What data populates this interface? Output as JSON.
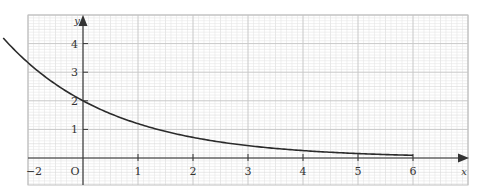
{
  "chart_data": {
    "type": "line",
    "title": "",
    "xlabel": "x",
    "ylabel": "y",
    "origin_label": "O",
    "xlim": [
      -1,
      7
    ],
    "ylim": [
      -0.95,
      5.05
    ],
    "x_tick_values": [
      1,
      2,
      3,
      4,
      5,
      6
    ],
    "x_tick_labels": [
      "1",
      "2",
      "3",
      "4",
      "5",
      "6"
    ],
    "left_edge_label": "−2",
    "y_tick_values": [
      1,
      2,
      3,
      4
    ],
    "y_tick_labels": [
      "1",
      "2",
      "3",
      "4"
    ],
    "grid": true,
    "minor_grid_step": 0.1,
    "series": [
      {
        "name": "curve",
        "function_estimate": "y = 2·(0.6)^x",
        "x": [
          -1.45,
          -1.25,
          -1,
          -0.75,
          -0.5,
          -0.25,
          0,
          0.5,
          1,
          1.5,
          2,
          2.5,
          3,
          3.5,
          4,
          4.5,
          5,
          5.5,
          6
        ],
        "y": [
          4.95,
          3.79,
          3.33,
          2.93,
          2.58,
          2.27,
          2.0,
          1.55,
          1.2,
          0.93,
          0.72,
          0.56,
          0.43,
          0.33,
          0.26,
          0.2,
          0.16,
          0.12,
          0.09
        ]
      }
    ]
  },
  "colors": {
    "curve": "#2b2b2b",
    "axis": "#333333",
    "major_grid": "#c8c8c8",
    "minor_grid": "#e6e6e6"
  }
}
